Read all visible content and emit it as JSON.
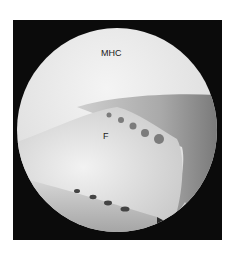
{
  "figure": {
    "type": "arthroscopic view",
    "labels": [
      {
        "id": "mhc",
        "text": "MHC"
      },
      {
        "id": "f",
        "text": "F"
      }
    ],
    "colors": {
      "background": "#ffffff",
      "frame": "#0b0b0b",
      "tissue_light": "#e8e8e8",
      "tissue_mid": "#b9b9b9",
      "tissue_dark": "#6f6f6f"
    }
  }
}
